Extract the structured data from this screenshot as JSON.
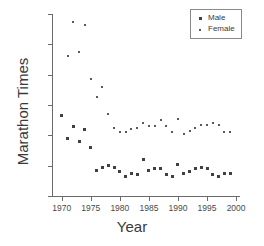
{
  "chart_data": {
    "type": "scatter",
    "title": "",
    "xlabel": "Year",
    "ylabel": "Marathon Times",
    "xlim": [
      1968.5,
      2000.5
    ],
    "ylim": [
      2.0,
      3.2
    ],
    "xticks": [
      1970,
      1975,
      1980,
      1985,
      1990,
      1995,
      2000
    ],
    "yticks": [
      2.0,
      2.2,
      2.4,
      2.6,
      2.8,
      3.0,
      3.2
    ],
    "xtick_labels": [
      "1970",
      "1975",
      "1980",
      "1985",
      "1990",
      "1995",
      "2000"
    ],
    "ytick_labels": [
      "2.0",
      "2.2",
      "2.4",
      "2.6",
      "2.8",
      "3.0",
      "3.2"
    ],
    "grid": false,
    "legend_position": "top-right",
    "x": [
      1970,
      1971,
      1972,
      1973,
      1974,
      1975,
      1976,
      1977,
      1978,
      1979,
      1980,
      1981,
      1982,
      1983,
      1984,
      1985,
      1986,
      1987,
      1988,
      1989,
      1990,
      1991,
      1992,
      1993,
      1994,
      1995,
      1996,
      1997,
      1998,
      1999
    ],
    "series": [
      {
        "name": "Male",
        "marker": "filled-square",
        "color": "#404040",
        "values": [
          2.53,
          2.38,
          2.46,
          2.36,
          2.44,
          2.32,
          2.17,
          2.19,
          2.2,
          2.19,
          2.16,
          2.13,
          2.15,
          2.14,
          2.24,
          2.17,
          2.18,
          2.18,
          2.14,
          2.13,
          2.21,
          2.15,
          2.16,
          2.18,
          2.19,
          2.18,
          2.14,
          2.13,
          2.15,
          2.15
        ]
      },
      {
        "name": "Female",
        "marker": "small-dot",
        "color": "#5a5a5a",
        "values": [
          null,
          2.92,
          3.15,
          2.95,
          3.13,
          2.77,
          2.65,
          2.72,
          2.54,
          2.45,
          2.42,
          2.42,
          2.44,
          2.45,
          2.48,
          2.46,
          2.46,
          2.5,
          2.46,
          2.42,
          2.51,
          2.41,
          2.43,
          2.45,
          2.47,
          2.47,
          2.48,
          2.47,
          2.42,
          2.42
        ]
      }
    ]
  },
  "legend": {
    "items": [
      {
        "label": "Male",
        "marker": "filled-square"
      },
      {
        "label": "Female",
        "marker": "small-dot"
      }
    ]
  }
}
